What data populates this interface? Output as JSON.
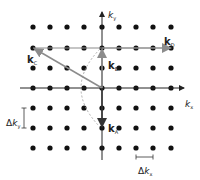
{
  "figure": {
    "title": "",
    "colors": {
      "dots": "#111111",
      "axes": "#222222",
      "gray_vector": "#8c8c8c",
      "dark_vector": "#333333",
      "arc": "#9a9a9a",
      "background": "#ffffff"
    },
    "grid": {
      "columns_x": [
        33,
        50,
        67,
        84,
        102,
        119,
        136,
        153,
        171
      ],
      "rows_y": [
        27,
        48,
        68,
        88,
        108,
        128,
        148
      ],
      "dot_radius": 2.6,
      "origin": [
        102,
        88
      ]
    },
    "axes": {
      "x": {
        "label_main": "k",
        "label_sub": "x"
      },
      "y": {
        "label_main": "k",
        "label_sub": "y"
      }
    },
    "vectors": [
      {
        "id": "kA",
        "label_main": "k",
        "label_sub": "A",
        "from": [
          102,
          88
        ],
        "to": [
          102,
          128
        ],
        "style": "dark"
      },
      {
        "id": "kB",
        "label_main": "k",
        "label_sub": "B",
        "from": [
          102,
          88
        ],
        "to": [
          102,
          48
        ],
        "style": "gray"
      },
      {
        "id": "kC",
        "label_main": "k",
        "label_sub": "C",
        "from": [
          102,
          88
        ],
        "to": [
          33,
          48
        ],
        "style": "gray"
      },
      {
        "id": "kD",
        "label_main": "k",
        "label_sub": "D",
        "from": [
          102,
          48
        ],
        "to": [
          171,
          48
        ],
        "style": "gray"
      }
    ],
    "spacing_labels": {
      "dky": {
        "delta": "Δ",
        "main": "k",
        "sub": "y"
      },
      "dkx": {
        "delta": "Δ",
        "main": "k",
        "sub": "x"
      }
    }
  }
}
